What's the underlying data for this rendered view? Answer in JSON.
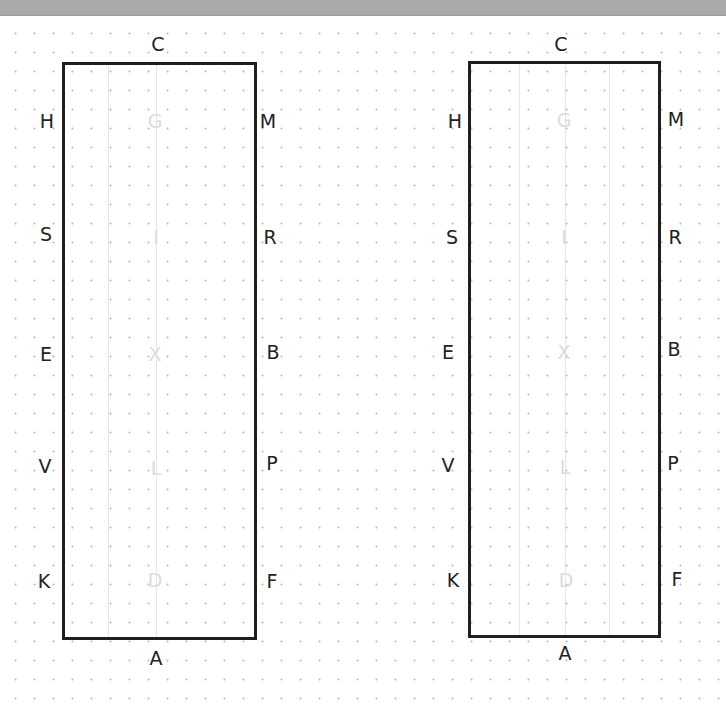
{
  "diagram": {
    "type": "dressage-arena-letters",
    "colors": {
      "border": "#1f1f1f",
      "letter": "#222222",
      "faint_letter": "#dcdcdc",
      "grid_dot": "#c8c8c8",
      "top_bar": "#a9a9a9"
    },
    "arenas": [
      {
        "name": "left-arena",
        "top_label": "C",
        "bottom_label": "A",
        "left_labels": [
          "H",
          "S",
          "E",
          "V",
          "K"
        ],
        "right_labels": [
          "M",
          "R",
          "B",
          "P",
          "F"
        ],
        "center_labels": [
          "G",
          "I",
          "X",
          "L",
          "D"
        ]
      },
      {
        "name": "right-arena",
        "top_label": "C",
        "bottom_label": "A",
        "left_labels": [
          "H",
          "S",
          "E",
          "V",
          "K"
        ],
        "right_labels": [
          "M",
          "R",
          "B",
          "P",
          "F"
        ],
        "center_labels": [
          "G",
          "I",
          "X",
          "L",
          "D"
        ]
      }
    ]
  }
}
